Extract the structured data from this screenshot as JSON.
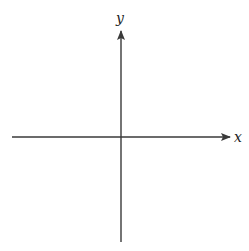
{
  "diagram": {
    "type": "cartesian-axes",
    "x_axis": {
      "label": "x",
      "direction": "right"
    },
    "y_axis": {
      "label": "y",
      "direction": "up"
    },
    "origin": "center",
    "colors": {
      "axis": "#3a3a3a",
      "background": "#ffffff"
    }
  }
}
